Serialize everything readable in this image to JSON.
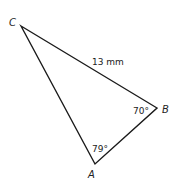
{
  "diagram": {
    "type": "triangle",
    "vertices": [
      {
        "name": "A",
        "x": 95,
        "y": 164
      },
      {
        "name": "B",
        "x": 157,
        "y": 108
      },
      {
        "name": "C",
        "x": 21,
        "y": 26
      }
    ],
    "labels": {
      "A": "A",
      "B": "B",
      "C": "C",
      "side_CB": "13 mm",
      "angle_B": "70°",
      "angle_A": "79°"
    },
    "stroke_color": "#1a1a1a"
  }
}
